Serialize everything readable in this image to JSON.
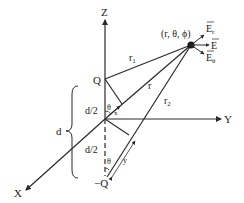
{
  "diagram": {
    "colors": {
      "line": "#2a2a2a",
      "text": "#222222",
      "background": "#ffffff"
    },
    "axes": {
      "z": "Z",
      "y": "Y",
      "x": "X"
    },
    "charges": {
      "positive": "Q",
      "negative": "−Q"
    },
    "point_label": "(r, θ, ϕ)",
    "distances": {
      "r1": "r",
      "r1_sub": "1",
      "r": "r",
      "r2": "r",
      "r2_sub": "2"
    },
    "separation": {
      "total": "d",
      "upper_half": "d/2",
      "lower_half": "d/2"
    },
    "angles": {
      "upper": "θ",
      "lower": "θ"
    },
    "offsets": {
      "x": "x",
      "y": "y"
    },
    "field_vectors": {
      "er": "E",
      "er_sub": "r",
      "e": "E",
      "etheta": "E",
      "etheta_sub": "θ"
    }
  }
}
